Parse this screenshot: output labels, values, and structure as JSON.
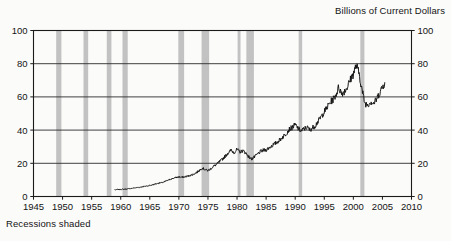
{
  "chart_data": {
    "type": "line",
    "title": "Billions of Current Dollars",
    "subtitle": "",
    "caption": "Recessions shaded",
    "xlabel": "",
    "ylabel": "",
    "xlim": [
      1945,
      2010
    ],
    "ylim": [
      0,
      100
    ],
    "grid": true,
    "legend_position": "none",
    "dual_y_axis": true,
    "series_color": "#111111",
    "recession_color": "#c2c2c2",
    "axis_color": "#1a1a1a",
    "grid_color": "#2b2b2b",
    "x_ticks": [
      1945,
      1950,
      1955,
      1960,
      1965,
      1970,
      1975,
      1980,
      1985,
      1990,
      1995,
      2000,
      2005,
      2010
    ],
    "y_ticks_left": [
      0,
      20,
      40,
      60,
      80,
      100
    ],
    "y_ticks_right": [
      0,
      20,
      40,
      60,
      80,
      100
    ],
    "recessions": [
      {
        "start": 1948.9,
        "end": 1949.8
      },
      {
        "start": 1953.6,
        "end": 1954.4
      },
      {
        "start": 1957.6,
        "end": 1958.4
      },
      {
        "start": 1960.3,
        "end": 1961.2
      },
      {
        "start": 1969.9,
        "end": 1970.9
      },
      {
        "start": 1973.9,
        "end": 1975.2
      },
      {
        "start": 1980.1,
        "end": 1980.6
      },
      {
        "start": 1981.6,
        "end": 1982.9
      },
      {
        "start": 1990.6,
        "end": 1991.2
      },
      {
        "start": 2001.2,
        "end": 2001.9
      }
    ],
    "series": [
      {
        "name": "Billions of Current Dollars",
        "x": [
          1959.0,
          1959.5,
          1960.0,
          1960.5,
          1961.0,
          1961.5,
          1962.0,
          1962.5,
          1963.0,
          1963.5,
          1964.0,
          1964.5,
          1965.0,
          1965.5,
          1966.0,
          1966.5,
          1967.0,
          1967.5,
          1968.0,
          1968.5,
          1969.0,
          1969.5,
          1970.0,
          1970.5,
          1971.0,
          1971.5,
          1972.0,
          1972.5,
          1973.0,
          1973.5,
          1974.0,
          1974.5,
          1975.0,
          1975.5,
          1976.0,
          1976.5,
          1977.0,
          1977.5,
          1978.0,
          1978.5,
          1979.0,
          1979.5,
          1980.0,
          1980.5,
          1981.0,
          1981.5,
          1982.0,
          1982.5,
          1983.0,
          1983.5,
          1984.0,
          1984.5,
          1985.0,
          1985.5,
          1986.0,
          1986.5,
          1987.0,
          1987.5,
          1988.0,
          1988.5,
          1989.0,
          1989.5,
          1990.0,
          1990.5,
          1991.0,
          1991.5,
          1992.0,
          1992.5,
          1993.0,
          1993.5,
          1994.0,
          1994.5,
          1995.0,
          1995.5,
          1996.0,
          1996.5,
          1997.0,
          1997.5,
          1998.0,
          1998.5,
          1999.0,
          1999.5,
          2000.0,
          2000.5,
          2001.0,
          2001.5,
          2002.0,
          2002.5,
          2003.0,
          2003.5,
          2004.0,
          2004.5,
          2005.0,
          2005.4
        ],
        "values": [
          4.0,
          4.2,
          4.3,
          4.4,
          4.5,
          4.7,
          5.0,
          5.2,
          5.4,
          5.7,
          6.0,
          6.3,
          6.7,
          7.0,
          7.6,
          8.0,
          8.3,
          8.8,
          9.6,
          10.3,
          11.0,
          11.4,
          11.8,
          11.5,
          11.9,
          12.2,
          12.8,
          13.4,
          14.3,
          15.6,
          17.2,
          16.2,
          15.6,
          16.8,
          18.2,
          19.4,
          21.0,
          22.6,
          24.4,
          26.5,
          27.8,
          26.5,
          28.3,
          26.8,
          27.6,
          26.2,
          24.0,
          22.6,
          23.8,
          25.4,
          27.0,
          27.8,
          28.0,
          29.4,
          30.6,
          31.8,
          33.0,
          34.6,
          36.4,
          38.2,
          40.6,
          41.6,
          43.2,
          41.0,
          39.4,
          40.6,
          41.8,
          40.2,
          41.4,
          43.0,
          45.6,
          48.2,
          51.0,
          53.8,
          56.6,
          58.4,
          61.2,
          66.0,
          62.0,
          63.6,
          66.2,
          70.4,
          74.0,
          79.0,
          74.0,
          64.0,
          56.0,
          55.4,
          57.2,
          56.0,
          58.6,
          62.4,
          66.0,
          68.6
        ]
      }
    ]
  }
}
